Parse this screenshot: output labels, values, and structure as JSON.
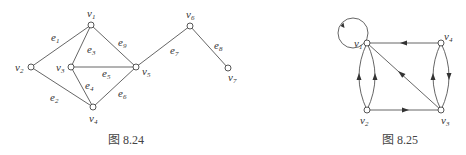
{
  "figures": [
    {
      "id": "fig-8-24",
      "caption": "图 8.24",
      "type": "undirected-graph",
      "nodes": [
        {
          "id": "v1",
          "label": "v",
          "sub": "1",
          "x": 91,
          "y": 25,
          "lx": 87,
          "ly": 17
        },
        {
          "id": "v2",
          "label": "v",
          "sub": "2",
          "x": 31,
          "y": 67,
          "lx": 15,
          "ly": 71
        },
        {
          "id": "v3",
          "label": "v",
          "sub": "3",
          "x": 71,
          "y": 67,
          "lx": 56,
          "ly": 71
        },
        {
          "id": "v4",
          "label": "v",
          "sub": "4",
          "x": 93,
          "y": 107,
          "lx": 89,
          "ly": 122
        },
        {
          "id": "v5",
          "label": "v",
          "sub": "5",
          "x": 136,
          "y": 67,
          "lx": 142,
          "ly": 75
        },
        {
          "id": "v6",
          "label": "v",
          "sub": "6",
          "x": 190,
          "y": 26,
          "lx": 186,
          "ly": 18
        },
        {
          "id": "v7",
          "label": "v",
          "sub": "7",
          "x": 228,
          "y": 68,
          "lx": 228,
          "ly": 81
        }
      ],
      "edges": [
        {
          "id": "e1",
          "from": "v2",
          "to": "v1",
          "label": "e",
          "sub": "1",
          "lx": 51,
          "ly": 41
        },
        {
          "id": "e2",
          "from": "v2",
          "to": "v4",
          "label": "e",
          "sub": "2",
          "lx": 50,
          "ly": 101
        },
        {
          "id": "e3",
          "from": "v3",
          "to": "v1",
          "label": "e",
          "sub": "3",
          "lx": 87,
          "ly": 53
        },
        {
          "id": "e4",
          "from": "v3",
          "to": "v4",
          "label": "e",
          "sub": "4",
          "lx": 85,
          "ly": 89
        },
        {
          "id": "e5",
          "from": "v3",
          "to": "v5",
          "label": "e",
          "sub": "5",
          "lx": 102,
          "ly": 77
        },
        {
          "id": "e6",
          "from": "v4",
          "to": "v5",
          "label": "e",
          "sub": "6",
          "lx": 118,
          "ly": 97
        },
        {
          "id": "e7",
          "from": "v5",
          "to": "v6",
          "label": "e",
          "sub": "7",
          "lx": 170,
          "ly": 54
        },
        {
          "id": "e8",
          "from": "v6",
          "to": "v7",
          "label": "e",
          "sub": "8",
          "lx": 214,
          "ly": 49
        },
        {
          "id": "e9",
          "from": "v1",
          "to": "v5",
          "label": "e",
          "sub": "9",
          "lx": 118,
          "ly": 46
        }
      ],
      "caption_pos": {
        "x": 108,
        "y": 144
      }
    },
    {
      "id": "fig-8-25",
      "caption": "图 8.25",
      "type": "directed-graph",
      "nodes": [
        {
          "id": "v1",
          "label": "v",
          "sub": "1",
          "x": 367,
          "y": 43,
          "lx": 354,
          "ly": 47
        },
        {
          "id": "v2",
          "label": "v",
          "sub": "2",
          "x": 367,
          "y": 110,
          "lx": 360,
          "ly": 124
        },
        {
          "id": "v3",
          "label": "v",
          "sub": "3",
          "x": 441,
          "y": 110,
          "lx": 441,
          "ly": 124
        },
        {
          "id": "v4",
          "label": "v",
          "sub": "4",
          "x": 441,
          "y": 43,
          "lx": 444,
          "ly": 40
        }
      ],
      "arcs": [
        {
          "id": "a-loop-v1",
          "from": "v1",
          "to": "v1",
          "kind": "loop"
        },
        {
          "id": "a-v4-v1",
          "from": "v4",
          "to": "v1",
          "kind": "straight"
        },
        {
          "id": "a-v3-v1",
          "from": "v3",
          "to": "v1",
          "kind": "straight"
        },
        {
          "id": "a-v2-v3",
          "from": "v2",
          "to": "v3",
          "kind": "straight"
        },
        {
          "id": "a-v2-v1-left",
          "from": "v2",
          "to": "v1",
          "kind": "curve-left"
        },
        {
          "id": "a-v2-v1-right",
          "from": "v2",
          "to": "v1",
          "kind": "curve-right"
        },
        {
          "id": "a-v3-v4",
          "from": "v3",
          "to": "v4",
          "kind": "curve-left"
        },
        {
          "id": "a-v4-v3",
          "from": "v4",
          "to": "v3",
          "kind": "curve-right"
        }
      ],
      "caption_pos": {
        "x": 382,
        "y": 144
      }
    }
  ]
}
